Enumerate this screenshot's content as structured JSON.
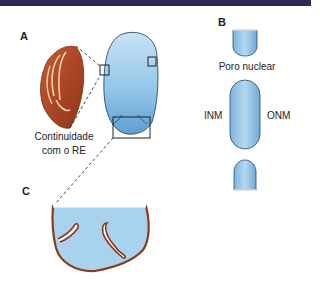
{
  "header": {
    "bar_color": "#2e2a55"
  },
  "panels": {
    "a": {
      "label": "A",
      "caption_line1": "Continuidade",
      "caption_line2": "com o RE"
    },
    "b": {
      "label": "B",
      "pore_label": "Poro nuclear",
      "inner_label": "INM",
      "outer_label": "ONM"
    },
    "c": {
      "label": "C"
    }
  },
  "colors": {
    "nucleus_fill": "#8ec3e6",
    "nucleus_stroke": "#2a4a6a",
    "membrane_brown": "#8b3a1e",
    "organelle_red": "#b3472a"
  }
}
